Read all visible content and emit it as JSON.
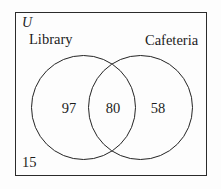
{
  "diagram": {
    "type": "venn",
    "universe_label": "U",
    "sets": [
      {
        "name": "library",
        "label": "Library"
      },
      {
        "name": "cafeteria",
        "label": "Cafeteria"
      }
    ],
    "regions": [
      {
        "name": "library-only",
        "value": "97"
      },
      {
        "name": "both",
        "value": "80"
      },
      {
        "name": "cafeteria-only",
        "value": "58"
      },
      {
        "name": "neither",
        "value": "15"
      }
    ],
    "colors": {
      "stroke": "#242424",
      "border": "#2b2b2b",
      "background": "#fdfdfd",
      "text": "#1c1c1c"
    }
  }
}
